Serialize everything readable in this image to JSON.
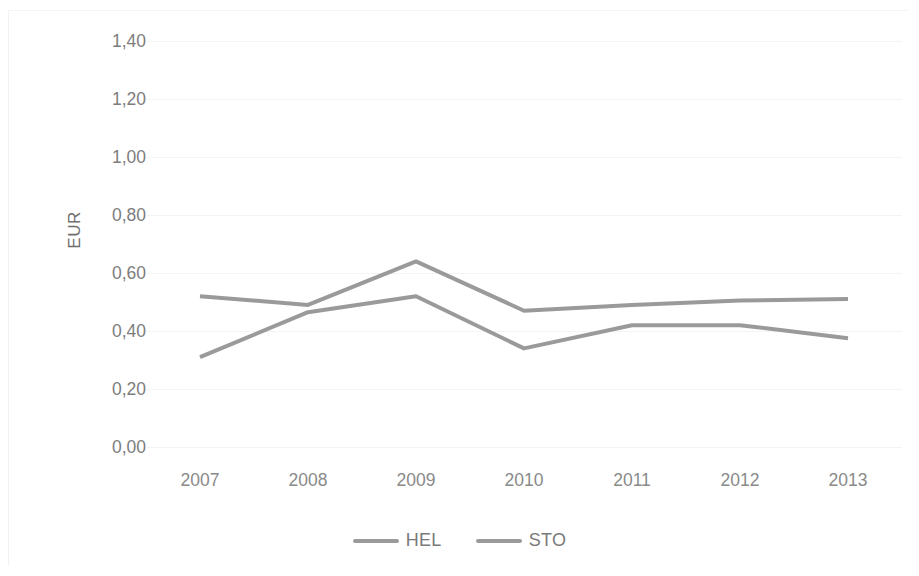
{
  "chart_data": {
    "type": "line",
    "title": "",
    "subtitle": "",
    "xlabel": "",
    "ylabel": "EUR",
    "categories": [
      "2007",
      "2008",
      "2009",
      "2010",
      "2011",
      "2012",
      "2013"
    ],
    "series": [
      {
        "name": "HEL",
        "color": "#9a9a9a",
        "values": [
          0.52,
          0.49,
          0.64,
          0.47,
          0.49,
          0.505,
          0.51
        ]
      },
      {
        "name": "STO",
        "color": "#9a9a9a",
        "values": [
          0.31,
          0.465,
          0.52,
          0.34,
          0.42,
          0.42,
          0.375
        ]
      }
    ],
    "ylim": [
      0.0,
      1.4
    ],
    "ytick_step": 0.2,
    "ytick_labels": [
      "0,00",
      "0,20",
      "0,40",
      "0,60",
      "0,80",
      "1,00",
      "1,20",
      "1,40"
    ],
    "ytick_values": [
      0.0,
      0.2,
      0.4,
      0.6,
      0.8,
      1.0,
      1.2,
      1.4
    ],
    "grid": "horizontal",
    "grid_color": "#f4f4f4",
    "legend_position": "bottom",
    "decimal_separator": ","
  },
  "legend": {
    "items": [
      {
        "label": "HEL",
        "swatch": "line-swatch-icon"
      },
      {
        "label": "STO",
        "swatch": "line-swatch-icon"
      }
    ]
  },
  "axes": {
    "y_title": "EUR"
  },
  "colors": {
    "line": "#9a9a9a",
    "grid": "#f4f4f4",
    "tick_text": "#7d7d7d",
    "background": "#ffffff"
  }
}
